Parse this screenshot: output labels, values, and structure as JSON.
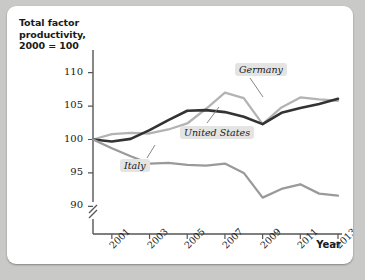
{
  "chart_data": {
    "type": "line",
    "title": "",
    "ylabel": "Total factor productivity, 2000 = 100",
    "xlabel": "Year",
    "x": [
      2000,
      2001,
      2002,
      2003,
      2004,
      2005,
      2006,
      2007,
      2008,
      2009,
      2010,
      2011,
      2012,
      2013
    ],
    "xtick_labels": [
      "2001",
      "2003",
      "2005",
      "2007",
      "2009",
      "2011",
      "2013"
    ],
    "xticks": [
      2001,
      2003,
      2005,
      2007,
      2009,
      2011,
      2013
    ],
    "yticks": [
      90,
      95,
      100,
      105,
      110
    ],
    "ytick_labels": [
      "90",
      "95",
      "100",
      "105",
      "110"
    ],
    "ylim": [
      88.5,
      111.5
    ],
    "xlim": [
      2000,
      2013
    ],
    "axis_break": true,
    "grid": false,
    "legend": "inline-labels",
    "series": [
      {
        "name": "Germany",
        "color": "#b3b3b3",
        "values": [
          100.0,
          100.8,
          101.0,
          100.9,
          101.5,
          102.4,
          104.6,
          107.0,
          106.2,
          102.3,
          104.8,
          106.3,
          106.0,
          105.8
        ]
      },
      {
        "name": "United States",
        "color": "#333333",
        "values": [
          100.0,
          99.7,
          100.1,
          101.4,
          102.9,
          104.3,
          104.4,
          104.1,
          103.4,
          102.3,
          104.0,
          104.7,
          105.3,
          106.1
        ]
      },
      {
        "name": "Italy",
        "color": "#9a9a9a",
        "values": [
          100.0,
          98.7,
          97.5,
          96.4,
          96.5,
          96.2,
          96.1,
          96.4,
          95.0,
          91.3,
          92.6,
          93.3,
          91.9,
          91.6
        ]
      }
    ]
  },
  "axis": {
    "y_title": "Total factor\nproductivity,\n2000 = 100",
    "y_title_line1": "Total factor",
    "y_title_line2": "productivity,",
    "y_title_line3": "2000 = 100",
    "x_title": "Year"
  },
  "labels": {
    "germany": "Germany",
    "united_states": "United States",
    "italy": "Italy"
  },
  "colors": {
    "germany": "#b3b3b3",
    "united_states": "#333333",
    "italy": "#9a9a9a",
    "axis": "#555555",
    "panel": "#ffffff",
    "backdrop": "#c9c9c7",
    "label_background": "#e4e4e2"
  }
}
